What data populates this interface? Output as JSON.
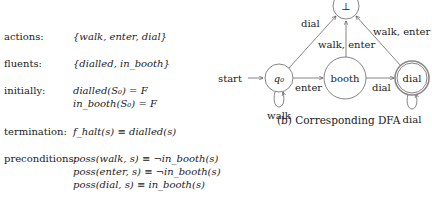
{
  "spec": {
    "actions": {
      "label": "actions:",
      "value": "{walk, enter, dial}"
    },
    "fluents": {
      "label": "fluents:",
      "value": "{dialled, in_booth}"
    },
    "initially": {
      "label": "initially:",
      "lines": [
        "dialled(S₀) = F",
        "in_booth(S₀) = F"
      ]
    },
    "termination": {
      "label": "termination:",
      "value": "f_halt(s) ≡ dialled(s)"
    },
    "preconditions": {
      "label": "preconditions:",
      "lines": [
        "poss(walk, s) ≡ ¬in_booth(s)",
        "poss(enter, s) ≡ ¬in_booth(s)",
        "poss(dial, s) ≡ in_booth(s)"
      ]
    }
  },
  "dfa": {
    "caption": "(b) Corresponding DFA",
    "start_label": "start",
    "states": [
      {
        "id": "bottom",
        "label": "⊥",
        "accepting": false
      },
      {
        "id": "q0",
        "label": "q₀",
        "accepting": false
      },
      {
        "id": "booth",
        "label": "booth",
        "accepting": false
      },
      {
        "id": "dial",
        "label": "dial",
        "accepting": true
      }
    ],
    "transitions": [
      {
        "from": "q0",
        "to": "bottom",
        "label": "dial"
      },
      {
        "from": "q0",
        "to": "booth",
        "label": "enter"
      },
      {
        "from": "q0",
        "to": "q0",
        "label": "walk"
      },
      {
        "from": "booth",
        "to": "bottom",
        "label": "walk, enter"
      },
      {
        "from": "booth",
        "to": "dial",
        "label": "dial"
      },
      {
        "from": "dial",
        "to": "bottom",
        "label": "walk, enter"
      },
      {
        "from": "dial",
        "to": "dial",
        "label": "dial"
      }
    ]
  }
}
